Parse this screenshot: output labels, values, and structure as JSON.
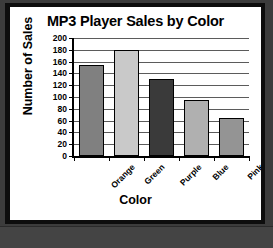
{
  "chart_data": {
    "type": "bar",
    "title": "MP3 Player Sales by Color",
    "xlabel": "Color",
    "ylabel": "Number of Sales",
    "categories": [
      "Orange",
      "Green",
      "Purple",
      "Blue",
      "Pink"
    ],
    "values": [
      155,
      180,
      130,
      95,
      65
    ],
    "bar_colors": [
      "#808080",
      "#c9c9c9",
      "#3a3a3a",
      "#b0b0b0",
      "#949494"
    ],
    "ylim": [
      0,
      200
    ],
    "ytick_step": 20,
    "ytick_labels": [
      "200",
      "180",
      "160",
      "140",
      "120",
      "100",
      "80",
      "60",
      "40",
      "20",
      "0"
    ],
    "grid": true,
    "legend": "none"
  },
  "frame": {
    "border_color": "#0d0d0d",
    "background_color": "#3c3c3c",
    "card_color": "#ffffff"
  }
}
